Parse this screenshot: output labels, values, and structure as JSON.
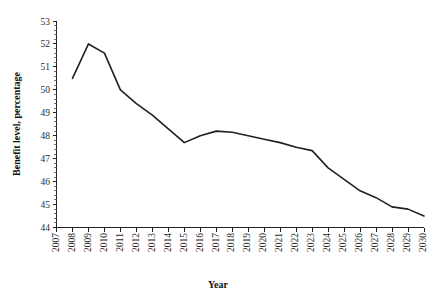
{
  "chart_data": {
    "type": "line",
    "title": "",
    "xlabel": "Year",
    "ylabel": "Benefit level, percentage",
    "xlim": [
      2007,
      2030
    ],
    "ylim": [
      44,
      53
    ],
    "grid": false,
    "legend": null,
    "y_ticks": [
      44,
      45,
      46,
      47,
      48,
      49,
      50,
      51,
      52,
      53
    ],
    "y_minor_ticks_per_interval": 4,
    "x_tick_labels": [
      "2007",
      "2008",
      "2009",
      "2010",
      "2011",
      "2012",
      "2013",
      "2014",
      "2015",
      "2016",
      "2017",
      "2018",
      "2019",
      "2020",
      "2021",
      "2022",
      "2023",
      "2024",
      "2025",
      "2026",
      "2027",
      "2028",
      "2029",
      "2030"
    ],
    "x": [
      2008,
      2009,
      2010,
      2011,
      2012,
      2013,
      2014,
      2015,
      2016,
      2017,
      2018,
      2019,
      2020,
      2021,
      2022,
      2023,
      2024,
      2025,
      2026,
      2027,
      2028,
      2029,
      2030
    ],
    "series": [
      {
        "name": "Benefit level",
        "color": "#231f20",
        "values": [
          50.5,
          52.0,
          51.6,
          50.0,
          49.4,
          48.9,
          48.3,
          47.7,
          48.0,
          48.2,
          48.15,
          48.0,
          47.85,
          47.7,
          47.5,
          47.35,
          46.6,
          46.1,
          45.6,
          45.3,
          44.9,
          44.8,
          44.5
        ]
      }
    ]
  },
  "axes": {
    "x_title": "Year",
    "y_title": "Benefit level, percentage"
  },
  "y_labels": {
    "t0": "44",
    "t1": "45",
    "t2": "46",
    "t3": "47",
    "t4": "48",
    "t5": "49",
    "t6": "50",
    "t7": "51",
    "t8": "52",
    "t9": "53"
  },
  "x_labels": {
    "y2007": "2007",
    "y2008": "2008",
    "y2009": "2009",
    "y2010": "2010",
    "y2011": "2011",
    "y2012": "2012",
    "y2013": "2013",
    "y2014": "2014",
    "y2015": "2015",
    "y2016": "2016",
    "y2017": "2017",
    "y2018": "2018",
    "y2019": "2019",
    "y2020": "2020",
    "y2021": "2021",
    "y2022": "2022",
    "y2023": "2023",
    "y2024": "2024",
    "y2025": "2025",
    "y2026": "2026",
    "y2027": "2027",
    "y2028": "2028",
    "y2029": "2029",
    "y2030": "2030"
  }
}
